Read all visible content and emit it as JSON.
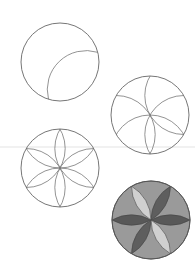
{
  "figure": {
    "steps": [
      {
        "id": 1,
        "label": "circle with one arc",
        "center": [
          60,
          62
        ],
        "radius": 39
      },
      {
        "id": 2,
        "label": "circle with several arcs",
        "center": [
          150,
          115
        ],
        "radius": 39
      },
      {
        "id": 3,
        "label": "complete six-petal rosette",
        "center": [
          60,
          168
        ],
        "radius": 39
      },
      {
        "id": 4,
        "label": "shaded rosette",
        "center": [
          151,
          220
        ],
        "radius": 39
      }
    ],
    "divider_y": 147,
    "colors": {
      "stroke": "#666666",
      "divider": "#d8d8d8",
      "fill_background": "#9a9a9a",
      "fill_petal_dark": "#585858",
      "fill_petal_light": "#d0d0d0",
      "fill_petal_mid": "#6a6a6a"
    }
  }
}
